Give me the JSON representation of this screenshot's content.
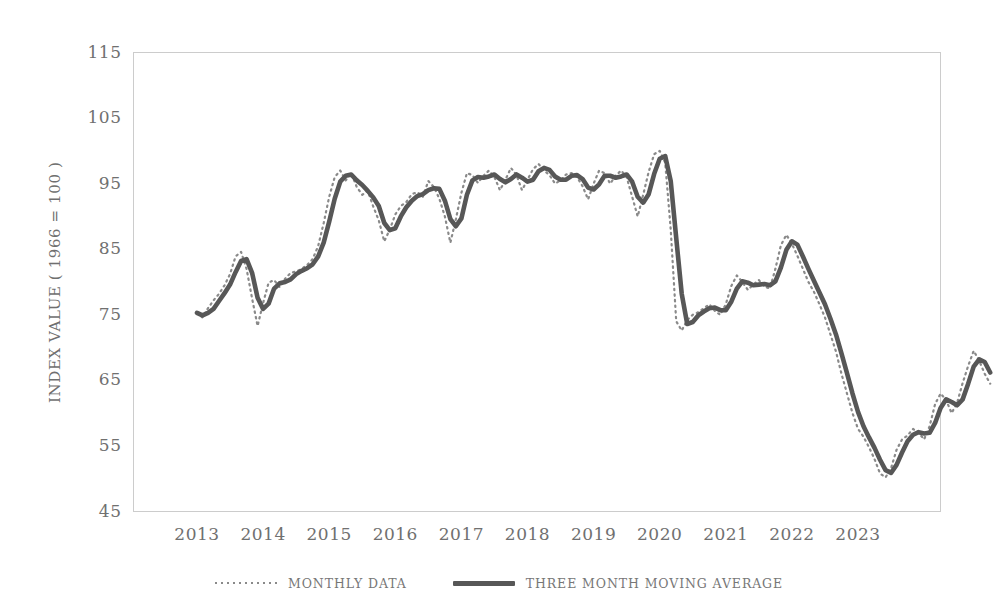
{
  "chart_data": {
    "type": "line",
    "title": "",
    "xlabel": "",
    "ylabel": "INDEX VALUE ( 1966 = 100 )",
    "ylim": [
      45,
      115
    ],
    "yticks": [
      45,
      55,
      65,
      75,
      85,
      95,
      105,
      115
    ],
    "xlim": [
      "2013-01",
      "2023-10"
    ],
    "xticks": [
      "2013",
      "2014",
      "2015",
      "2016",
      "2017",
      "2018",
      "2019",
      "2020",
      "2021",
      "2022",
      "2023"
    ],
    "grid": false,
    "legend_position": "bottom",
    "line_color": "#575757",
    "dotted_color": "#8a8a8a",
    "axis_color": "#cccccc",
    "x_start_year": 2013,
    "x_step_months": 1,
    "series": [
      {
        "name": "MONTHLY DATA",
        "style": "dotted",
        "values": [
          75.3,
          74.6,
          76.0,
          77.2,
          78.2,
          79.5,
          81.2,
          83.9,
          84.6,
          82.0,
          77.5,
          73.3,
          76.8,
          79.9,
          80.3,
          79.2,
          80.5,
          81.4,
          81.6,
          82.0,
          82.6,
          83.5,
          85.5,
          89.0,
          93.0,
          96.0,
          97.0,
          95.5,
          96.6,
          94.5,
          93.3,
          93.9,
          91.5,
          89.4,
          86.2,
          88.0,
          90.3,
          91.6,
          92.2,
          93.4,
          93.7,
          93.0,
          95.4,
          94.5,
          92.7,
          90.0,
          86.0,
          89.6,
          93.6,
          96.6,
          96.3,
          95.1,
          96.2,
          97.0,
          96.0,
          94.0,
          95.6,
          97.4,
          96.3,
          94.0,
          95.6,
          97.2,
          98.0,
          97.0,
          96.3,
          95.0,
          95.5,
          96.4,
          96.6,
          96.0,
          94.6,
          92.6,
          95.0,
          97.0,
          96.6,
          95.0,
          96.2,
          97.0,
          96.0,
          93.0,
          90.0,
          93.3,
          96.8,
          99.5,
          100.0,
          98.2,
          88.0,
          74.0,
          72.6,
          74.2,
          75.0,
          75.4,
          76.0,
          76.6,
          75.6,
          75.0,
          76.6,
          79.4,
          81.0,
          80.0,
          78.8,
          79.6,
          80.3,
          79.3,
          79.0,
          82.0,
          85.6,
          87.2,
          85.8,
          84.0,
          82.0,
          80.0,
          78.5,
          76.6,
          74.6,
          72.0,
          69.4,
          66.0,
          63.0,
          60.0,
          57.6,
          56.4,
          54.8,
          53.0,
          50.8,
          50.2,
          51.6,
          54.4,
          56.0,
          56.6,
          57.6,
          57.0,
          56.0,
          58.0,
          61.4,
          63.0,
          62.0,
          60.0,
          61.6,
          64.6,
          67.2,
          69.5,
          68.0,
          66.0,
          64.5
        ]
      },
      {
        "name": "THREE MONTH MOVING AVERAGE",
        "style": "solid",
        "values": [
          75.3,
          74.9,
          75.3,
          75.9,
          77.1,
          78.3,
          79.6,
          81.5,
          83.2,
          83.5,
          81.4,
          77.6,
          75.9,
          76.7,
          79.0,
          79.8,
          80.0,
          80.4,
          81.2,
          81.7,
          82.1,
          82.7,
          83.9,
          86.0,
          89.2,
          92.7,
          95.3,
          96.2,
          96.4,
          95.5,
          94.8,
          93.9,
          92.9,
          91.6,
          89.0,
          87.9,
          88.2,
          90.0,
          91.4,
          92.4,
          93.1,
          93.4,
          94.0,
          94.3,
          94.2,
          92.4,
          89.6,
          88.5,
          89.7,
          93.3,
          95.5,
          96.0,
          95.9,
          96.1,
          96.4,
          95.7,
          95.2,
          95.7,
          96.4,
          95.9,
          95.3,
          95.6,
          96.9,
          97.4,
          97.1,
          96.1,
          95.6,
          95.6,
          96.2,
          96.3,
          95.7,
          94.4,
          94.1,
          94.9,
          96.2,
          96.2,
          95.9,
          96.1,
          96.4,
          95.3,
          93.0,
          92.1,
          93.4,
          96.5,
          98.8,
          99.2,
          95.4,
          86.7,
          78.2,
          73.6,
          73.9,
          74.9,
          75.5,
          76.0,
          76.1,
          75.7,
          75.7,
          77.0,
          79.0,
          80.1,
          79.9,
          79.5,
          79.6,
          79.7,
          79.5,
          80.1,
          82.2,
          84.9,
          86.2,
          85.7,
          83.9,
          82.0,
          80.2,
          78.4,
          76.6,
          74.4,
          72.0,
          69.1,
          66.1,
          63.0,
          60.2,
          58.0,
          56.3,
          54.7,
          52.9,
          51.3,
          50.9,
          52.1,
          54.0,
          55.7,
          56.7,
          57.1,
          56.9,
          57.0,
          58.5,
          60.8,
          62.1,
          61.7,
          61.2,
          62.1,
          64.5,
          67.1,
          68.2,
          67.8,
          66.2
        ]
      }
    ]
  },
  "legend": {
    "items": [
      {
        "label": "MONTHLY DATA",
        "style": "dotted"
      },
      {
        "label": "THREE MONTH MOVING AVERAGE",
        "style": "solid"
      }
    ]
  },
  "axes": {
    "y_title": "INDEX VALUE ( 1966 = 100 )",
    "y_ticks": [
      "115",
      "105",
      "95",
      "85",
      "75",
      "65",
      "55",
      "45"
    ],
    "x_ticks": [
      "2013",
      "2014",
      "2015",
      "2016",
      "2017",
      "2018",
      "2019",
      "2020",
      "2021",
      "2022",
      "2023"
    ]
  }
}
